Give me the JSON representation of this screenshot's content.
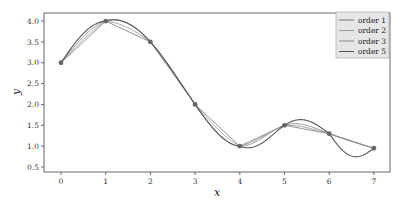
{
  "chart_data": {
    "type": "line",
    "title": "",
    "xlabel": "x",
    "ylabel": "y",
    "xlim": [
      -0.45,
      7.35
    ],
    "ylim": [
      0.4,
      4.15
    ],
    "grid": false,
    "legend_position": "upper right",
    "x_ticks": [
      "0",
      "1",
      "2",
      "3",
      "4",
      "5",
      "6",
      "7"
    ],
    "y_ticks": [
      "0.5",
      "1.0",
      "1.5",
      "2.0",
      "2.5",
      "3.0",
      "3.5",
      "4.0"
    ],
    "points": {
      "x": [
        0,
        1,
        2,
        3,
        4,
        5,
        6,
        7
      ],
      "y": [
        3.0,
        4.0,
        3.5,
        2.0,
        1.0,
        1.5,
        1.3,
        0.95
      ]
    },
    "series": [
      {
        "name": "order 1",
        "color": "#777777"
      },
      {
        "name": "order 2",
        "color": "#999999"
      },
      {
        "name": "order 3",
        "color": "#888888"
      },
      {
        "name": "order 5",
        "color": "#555555"
      }
    ],
    "legend": [
      "order 1",
      "order 2",
      "order 3",
      "order 5"
    ]
  }
}
